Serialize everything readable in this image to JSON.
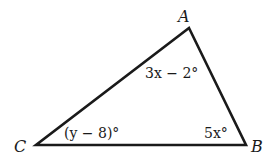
{
  "diagram": {
    "type": "triangle",
    "vertices": {
      "A": {
        "label": "A"
      },
      "B": {
        "label": "B"
      },
      "C": {
        "label": "C"
      }
    },
    "angles": {
      "A": "3x − 2°",
      "B": "5x°",
      "C": "(y − 8)°"
    },
    "colors": {
      "stroke": "#1a1a1a",
      "background": "#ffffff"
    }
  }
}
